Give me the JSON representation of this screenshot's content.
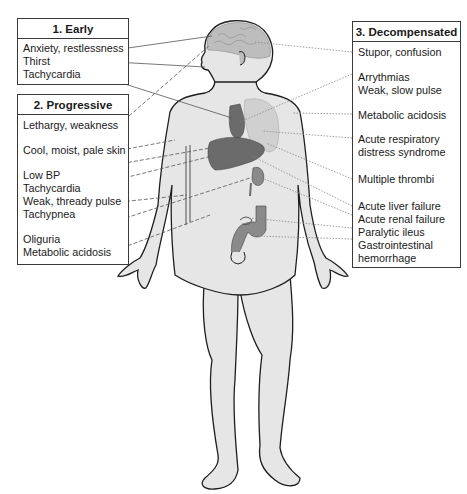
{
  "diagram": {
    "stages": [
      {
        "title": "1. Early",
        "items": [
          "Anxiety, restlessness",
          "Thirst",
          "Tachycardia"
        ]
      },
      {
        "title": "2. Progressive",
        "items": [
          "Lethargy, weakness",
          "Cool, moist, pale skin",
          "Low BP",
          "Tachycardia",
          "Weak, thready pulse",
          "Tachypnea",
          "Oliguria",
          "Metabolic acidosis"
        ]
      },
      {
        "title": "3. Decompensated",
        "items": [
          "Stupor, confusion",
          "Arrythmias",
          "Weak, slow pulse",
          "Metabolic acidosis",
          "Acute respiratory",
          "distress syndrome",
          "Multiple thrombi",
          "Acute liver failure",
          "Acute renal failure",
          "Paralytic ileus",
          "Gastrointestinal",
          "hemorrhage"
        ]
      }
    ],
    "colors": {
      "skin": "#e6e6e6",
      "outline": "#1e1e1e",
      "organ_dark": "#6b6b6b",
      "organ_mid": "#8a8a8a",
      "lung": "#d0d0d0",
      "brain": "#bdbdbd",
      "leader": "#555555"
    }
  }
}
